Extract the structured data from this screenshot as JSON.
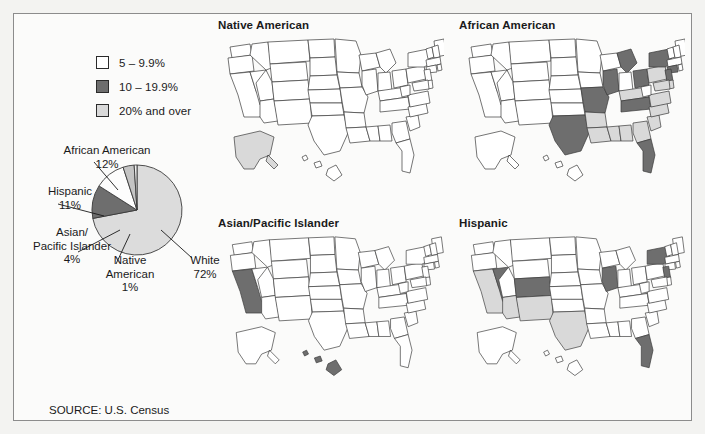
{
  "figure": {
    "source_note": "SOURCE: U.S. Census"
  },
  "legend": {
    "items": [
      {
        "label": "5 – 9.9%",
        "color": "#ffffff",
        "key": "low"
      },
      {
        "label": "10 – 19.9%",
        "color": "#6e6e6e",
        "key": "mid"
      },
      {
        "label": "20% and over",
        "color": "#d9d9d9",
        "key": "high"
      }
    ]
  },
  "colors": {
    "low": "#ffffff",
    "mid": "#6e6e6e",
    "high": "#d9d9d9",
    "unshaded": "#ffffff",
    "outline": "#3a3a3a",
    "frame": "#8c8c8c",
    "pie_white": "#dcdcdc",
    "pie_african_american": "#6e6e6e",
    "pie_hispanic": "#fdfdfd",
    "pie_asian": "#c4c4c4",
    "pie_native": "#efefef"
  },
  "chart_data": [
    {
      "type": "pie",
      "title": "",
      "legend_position": "callout-labels",
      "categories": [
        "White",
        "African American",
        "Hispanic",
        "Asian/Pacific Islander",
        "Native American"
      ],
      "values": [
        72,
        12,
        11,
        4,
        1
      ],
      "labels": [
        {
          "name": "African American",
          "pct": "12%",
          "text": "African American\n12%"
        },
        {
          "name": "Hispanic",
          "pct": "11%",
          "text": "Hispanic\n11%"
        },
        {
          "name": "Asian/Pacific Islander",
          "pct": "4%",
          "text": "Asian/\nPacific Islander\n4%"
        },
        {
          "name": "Native American",
          "pct": "1%",
          "text": "Native\nAmerican\n1%"
        },
        {
          "name": "White",
          "pct": "72%",
          "text": "White\n72%"
        }
      ],
      "unit": "percent of U.S. population"
    },
    {
      "type": "map",
      "title": "Native American",
      "legend_categories": [
        "5 – 9.9%",
        "10 – 19.9%",
        "20% and over"
      ],
      "shaded_states": [
        {
          "state": "AK",
          "class": "high"
        }
      ]
    },
    {
      "type": "map",
      "title": "African American",
      "legend_categories": [
        "5 – 9.9%",
        "10 – 19.9%",
        "20% and over"
      ],
      "shaded_states": [
        {
          "state": "TX",
          "class": "mid"
        },
        {
          "state": "MO",
          "class": "mid"
        },
        {
          "state": "AR",
          "class": "high"
        },
        {
          "state": "LA",
          "class": "high"
        },
        {
          "state": "MS",
          "class": "high"
        },
        {
          "state": "AL",
          "class": "high"
        },
        {
          "state": "GA",
          "class": "high"
        },
        {
          "state": "SC",
          "class": "high"
        },
        {
          "state": "NC",
          "class": "high"
        },
        {
          "state": "VA",
          "class": "high"
        },
        {
          "state": "MD",
          "class": "high"
        },
        {
          "state": "DE",
          "class": "high"
        },
        {
          "state": "TN",
          "class": "mid"
        },
        {
          "state": "FL",
          "class": "mid"
        },
        {
          "state": "IL",
          "class": "mid"
        },
        {
          "state": "MI",
          "class": "mid"
        },
        {
          "state": "OH",
          "class": "mid"
        },
        {
          "state": "NY",
          "class": "mid"
        },
        {
          "state": "NJ",
          "class": "mid"
        },
        {
          "state": "PA",
          "class": "high"
        },
        {
          "state": "CT",
          "class": "mid"
        },
        {
          "state": "KY",
          "class": "high"
        }
      ]
    },
    {
      "type": "map",
      "title": "Asian/Pacific Islander",
      "legend_categories": [
        "5 – 9.9%",
        "10 – 19.9%",
        "20% and over"
      ],
      "shaded_states": [
        {
          "state": "CA",
          "class": "mid"
        },
        {
          "state": "HI",
          "class": "mid"
        }
      ]
    },
    {
      "type": "map",
      "title": "Hispanic",
      "legend_categories": [
        "5 – 9.9%",
        "10 – 19.9%",
        "20% and over"
      ],
      "shaded_states": [
        {
          "state": "CA",
          "class": "high"
        },
        {
          "state": "AZ",
          "class": "high"
        },
        {
          "state": "NM",
          "class": "high"
        },
        {
          "state": "TX",
          "class": "high"
        },
        {
          "state": "NV",
          "class": "mid"
        },
        {
          "state": "CO",
          "class": "mid"
        },
        {
          "state": "IL",
          "class": "mid"
        },
        {
          "state": "NY",
          "class": "mid"
        },
        {
          "state": "NJ",
          "class": "mid"
        },
        {
          "state": "FL",
          "class": "mid"
        }
      ]
    }
  ],
  "maps": {
    "native_american": {
      "title": "Native American"
    },
    "african_american": {
      "title": "African American"
    },
    "asian_pacific": {
      "title": "Asian/Pacific Islander"
    },
    "hispanic": {
      "title": "Hispanic"
    }
  },
  "pie_labels": {
    "african_american_name": "African American",
    "african_american_pct": "12%",
    "hispanic_name": "Hispanic",
    "hispanic_pct": "11%",
    "asian_name1": "Asian/",
    "asian_name2": "Pacific Islander",
    "asian_pct": "4%",
    "native_name1": "Native",
    "native_name2": "American",
    "native_pct": "1%",
    "white_name": "White",
    "white_pct": "72%"
  }
}
